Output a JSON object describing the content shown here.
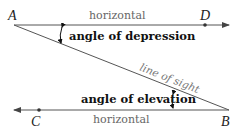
{
  "diagram": {
    "points": {
      "A": "A",
      "B": "B",
      "C": "C",
      "D": "D"
    },
    "labels": {
      "top_horizontal": "horizontal",
      "bottom_horizontal": "horizontal",
      "angle_depression": "angle of depression",
      "angle_elevation": "angle of elevation",
      "line_of_sight": "line of sight"
    },
    "colors": {
      "line": "#555555",
      "text": "#111111",
      "muted_text": "#666666"
    }
  }
}
